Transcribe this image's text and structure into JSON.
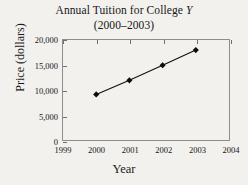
{
  "chart_data": {
    "type": "line",
    "title": "Annual Tuition for College Y",
    "title_plain": "Annual Tuition for College ",
    "title_italic": "Y",
    "subtitle": "(2000–2003)",
    "xlabel": "Year",
    "ylabel": "Price  (dollars)",
    "x": [
      2000,
      2001,
      2002,
      2003
    ],
    "values": [
      9200,
      12000,
      15000,
      18000
    ],
    "xlim": [
      1999,
      2004
    ],
    "ylim": [
      0,
      20000
    ],
    "xticks": [
      1999,
      2000,
      2001,
      2002,
      2003,
      2004
    ],
    "xtick_labels": [
      "1999",
      "2000",
      "2001",
      "2002",
      "2003",
      "2004"
    ],
    "yticks": [
      0,
      5000,
      10000,
      15000,
      20000
    ],
    "ytick_labels": [
      "0",
      "5,000",
      "10,000",
      "15,000",
      "20,000"
    ],
    "grid": false,
    "legend": null,
    "marker": "diamond",
    "line_color": "#111111",
    "marker_color": "#0d0d0d",
    "frame_color": "#8d8d8d",
    "background_color": "#f2f1ee"
  }
}
